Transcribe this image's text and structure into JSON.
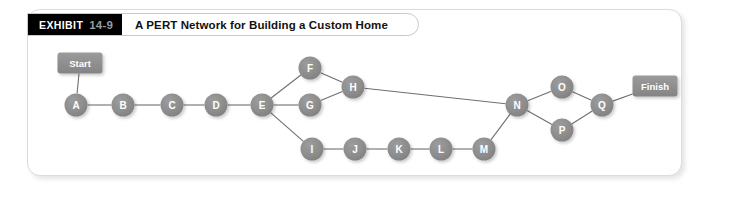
{
  "exhibit": {
    "tag_word": "EXHIBIT",
    "tag_number": "14-9",
    "title": "A PERT Network for Building a Custom Home"
  },
  "colors": {
    "node_fill": "#8c8c8c",
    "node_fill_light": "#a0a0a0",
    "terminal_fill": "#8c8c8c",
    "edge": "#6f6f6f",
    "label_text": "#ffffff",
    "tag_background": "#000000",
    "tag_number_text": "#9a9a9a",
    "panel_border": "#dcdcdc",
    "panel_background": "#ffffff"
  },
  "chart_data": {
    "type": "diagram",
    "title": "A PERT Network for Building a Custom Home",
    "diagram_kind": "PERT network",
    "nodes": [
      {
        "id": "Start",
        "label": "Start",
        "shape": "rounded-rect",
        "x": 80,
        "y": 63
      },
      {
        "id": "A",
        "label": "A",
        "shape": "circle",
        "x": 76,
        "y": 105
      },
      {
        "id": "B",
        "label": "B",
        "shape": "circle",
        "x": 123,
        "y": 105
      },
      {
        "id": "C",
        "label": "C",
        "shape": "circle",
        "x": 172,
        "y": 105
      },
      {
        "id": "D",
        "label": "D",
        "shape": "circle",
        "x": 216,
        "y": 105
      },
      {
        "id": "E",
        "label": "E",
        "shape": "circle",
        "x": 262,
        "y": 105
      },
      {
        "id": "F",
        "label": "F",
        "shape": "circle",
        "x": 310,
        "y": 68
      },
      {
        "id": "G",
        "label": "G",
        "shape": "circle",
        "x": 310,
        "y": 105
      },
      {
        "id": "H",
        "label": "H",
        "shape": "circle",
        "x": 353,
        "y": 87
      },
      {
        "id": "I",
        "label": "I",
        "shape": "circle",
        "x": 312,
        "y": 149
      },
      {
        "id": "J",
        "label": "J",
        "shape": "circle",
        "x": 355,
        "y": 149
      },
      {
        "id": "K",
        "label": "K",
        "shape": "circle",
        "x": 399,
        "y": 149
      },
      {
        "id": "L",
        "label": "L",
        "shape": "circle",
        "x": 441,
        "y": 149
      },
      {
        "id": "M",
        "label": "M",
        "shape": "circle",
        "x": 484,
        "y": 149
      },
      {
        "id": "N",
        "label": "N",
        "shape": "circle",
        "x": 517,
        "y": 105
      },
      {
        "id": "O",
        "label": "O",
        "shape": "circle",
        "x": 562,
        "y": 87
      },
      {
        "id": "P",
        "label": "P",
        "shape": "circle",
        "x": 562,
        "y": 130
      },
      {
        "id": "Q",
        "label": "Q",
        "shape": "circle",
        "x": 602,
        "y": 105
      },
      {
        "id": "Finish",
        "label": "Finish",
        "shape": "rounded-rect",
        "x": 655,
        "y": 86
      }
    ],
    "edges": [
      {
        "from": "Start",
        "to": "A"
      },
      {
        "from": "A",
        "to": "B"
      },
      {
        "from": "B",
        "to": "C"
      },
      {
        "from": "C",
        "to": "D"
      },
      {
        "from": "D",
        "to": "E"
      },
      {
        "from": "E",
        "to": "F"
      },
      {
        "from": "E",
        "to": "G"
      },
      {
        "from": "E",
        "to": "I"
      },
      {
        "from": "F",
        "to": "H"
      },
      {
        "from": "G",
        "to": "H"
      },
      {
        "from": "H",
        "to": "N"
      },
      {
        "from": "I",
        "to": "J"
      },
      {
        "from": "J",
        "to": "K"
      },
      {
        "from": "K",
        "to": "L"
      },
      {
        "from": "L",
        "to": "M"
      },
      {
        "from": "M",
        "to": "N"
      },
      {
        "from": "N",
        "to": "O"
      },
      {
        "from": "N",
        "to": "P"
      },
      {
        "from": "O",
        "to": "Q"
      },
      {
        "from": "P",
        "to": "Q"
      },
      {
        "from": "Q",
        "to": "Finish"
      }
    ],
    "node_radius": 11.5,
    "terminal_size": {
      "width": 45,
      "height": 21
    }
  }
}
